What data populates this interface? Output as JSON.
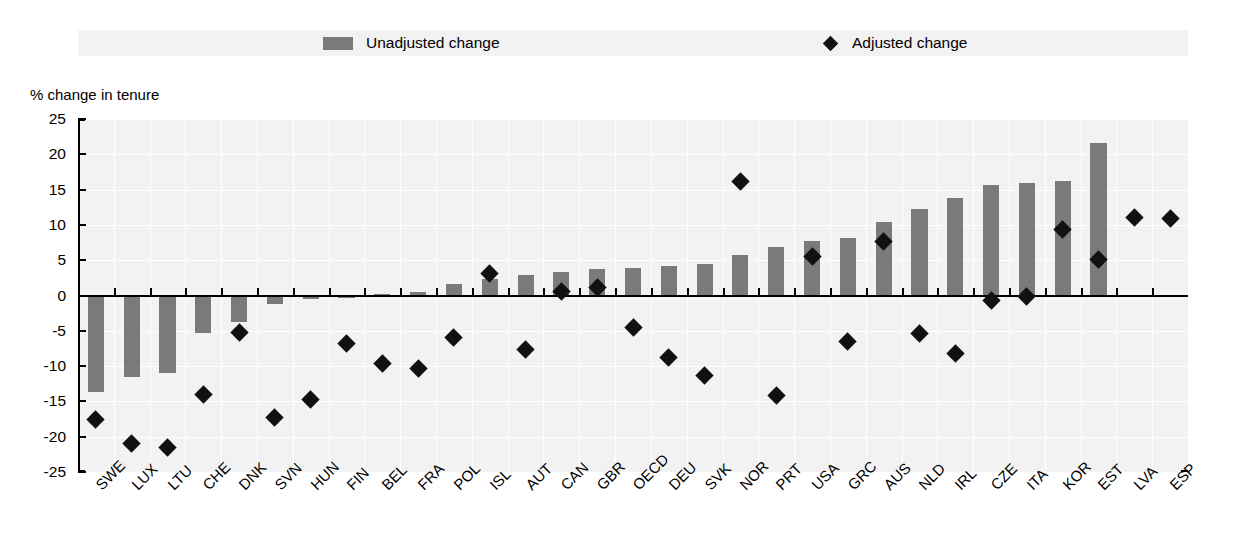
{
  "legend": {
    "bar_label": "Unadjusted change",
    "diamond_label": "Adjusted change",
    "bar_color": "#7a7a7a",
    "diamond_color": "#111111"
  },
  "axis": {
    "y_title": "% change in tenure",
    "y_ticks": [
      "25",
      "20",
      "15",
      "10",
      "5",
      "0",
      "-5",
      "-10",
      "-15",
      "-20",
      "-25"
    ]
  },
  "chart_data": {
    "type": "bar",
    "title": "",
    "xlabel": "",
    "ylabel": "% change in tenure",
    "ylim": [
      -25,
      25
    ],
    "ytick_values": [
      25,
      20,
      15,
      10,
      5,
      0,
      -5,
      -10,
      -15,
      -20,
      -25
    ],
    "grid": true,
    "legend_position": "top",
    "categories": [
      "SWE",
      "LUX",
      "LTU",
      "CHE",
      "DNK",
      "SVN",
      "HUN",
      "FIN",
      "BEL",
      "FRA",
      "POL",
      "ISL",
      "AUT",
      "CAN",
      "GBR",
      "OECD",
      "DEU",
      "SVK",
      "NOR",
      "PRT",
      "USA",
      "GRC",
      "AUS",
      "NLD",
      "IRL",
      "CZE",
      "ITA",
      "KOR",
      "EST",
      "LVA",
      "ESP"
    ],
    "series": [
      {
        "name": "Unadjusted change",
        "type": "bar",
        "color": "#7a7a7a",
        "values": [
          -13.7,
          -11.5,
          -11.0,
          -5.3,
          -3.8,
          -1.2,
          -0.5,
          -0.4,
          0.2,
          0.5,
          1.6,
          2.4,
          2.9,
          3.3,
          3.7,
          3.9,
          4.2,
          4.4,
          5.8,
          6.9,
          7.7,
          8.2,
          10.4,
          12.3,
          13.8,
          15.6,
          15.9,
          16.2,
          21.6,
          0,
          0
        ]
      },
      {
        "name": "Adjusted change",
        "type": "scatter",
        "color": "#111111",
        "values": [
          -17.5,
          -21.0,
          -21.5,
          -14.0,
          -5.2,
          -17.3,
          -14.8,
          -6.8,
          -9.6,
          -10.4,
          -5.9,
          3.1,
          -7.6,
          0.5,
          1.2,
          -4.6,
          -8.8,
          -11.4,
          16.1,
          -14.1,
          5.5,
          -6.5,
          7.7,
          -5.4,
          -8.2,
          -0.7,
          -0.2,
          9.3,
          5.1,
          11.0,
          10.9
        ]
      }
    ],
    "bar_values_by_category": {
      "SWE": -13.7,
      "LUX": -11.5,
      "LTU": -11.0,
      "CHE": -5.3,
      "DNK": -3.8,
      "SVN": -1.2,
      "HUN": -0.5,
      "FIN": -0.4,
      "BEL": 0.2,
      "FRA": 0.5,
      "POL": 1.6,
      "ISL": 2.4,
      "AUT": 2.9,
      "CAN": 3.3,
      "GBR": 3.7,
      "OECD": 3.9,
      "DEU": 4.2,
      "SVK": 4.4,
      "NOR": 5.8,
      "PRT": 6.9,
      "USA": 7.7,
      "GRC": 8.2,
      "AUS": 10.4,
      "NLD": 12.3,
      "IRL": 13.8,
      "CZE": 15.6,
      "ITA": 15.9,
      "KOR": 16.2,
      "EST": 21.6,
      "LVA": 0,
      "ESP": 0
    },
    "points": [
      {
        "category": "SWE",
        "bar": -13.7,
        "adjusted": -17.5
      },
      {
        "category": "LUX",
        "bar": -11.5,
        "adjusted": -21.0
      },
      {
        "category": "LTU",
        "bar": -11.0,
        "adjusted": -21.5
      },
      {
        "category": "CHE",
        "bar": -5.3,
        "adjusted": -14.0
      },
      {
        "category": "DNK",
        "bar": -3.8,
        "adjusted": -5.2
      },
      {
        "category": "SVN",
        "bar": -1.2,
        "adjusted": -17.3
      },
      {
        "category": "HUN",
        "bar": -0.5,
        "adjusted": -14.8
      },
      {
        "category": "FIN",
        "bar": -0.4,
        "adjusted": -6.8
      },
      {
        "category": "BEL",
        "bar": 0.2,
        "adjusted": -9.6
      },
      {
        "category": "FRA",
        "bar": 0.5,
        "adjusted": -10.4
      },
      {
        "category": "POL",
        "bar": 1.6,
        "adjusted": -5.9
      },
      {
        "category": "ISL",
        "bar": 2.4,
        "adjusted": 3.1
      },
      {
        "category": "AUT",
        "bar": 2.9,
        "adjusted": -7.6
      },
      {
        "category": "CAN",
        "bar": 3.3,
        "adjusted": 0.5
      },
      {
        "category": "GBR",
        "bar": 3.7,
        "adjusted": 1.2
      },
      {
        "category": "OECD",
        "bar": 3.9,
        "adjusted": -4.6
      },
      {
        "category": "DEU",
        "bar": 4.2,
        "adjusted": -8.8
      },
      {
        "category": "SVK",
        "bar": 4.4,
        "adjusted": -11.4
      },
      {
        "category": "NOR",
        "bar": 5.8,
        "adjusted": 16.1
      },
      {
        "category": "PRT",
        "bar": 6.9,
        "adjusted": -14.1
      },
      {
        "category": "USA",
        "bar": 7.7,
        "adjusted": 5.5
      },
      {
        "category": "GRC",
        "bar": 8.2,
        "adjusted": -6.5
      },
      {
        "category": "AUS",
        "bar": 10.4,
        "adjusted": 7.7
      },
      {
        "category": "NLD",
        "bar": 12.3,
        "adjusted": -5.4
      },
      {
        "category": "IRL",
        "bar": 13.8,
        "adjusted": -8.2
      },
      {
        "category": "CZE",
        "bar": 15.6,
        "adjusted": -0.7
      },
      {
        "category": "ITA",
        "bar": 15.9,
        "adjusted": -0.2
      },
      {
        "category": "KOR",
        "bar": 16.2,
        "adjusted": 9.3
      },
      {
        "category": "EST",
        "bar": 21.6,
        "adjusted": 5.1
      },
      {
        "category": "LVA",
        "bar": 0,
        "adjusted": 11.0
      },
      {
        "category": "ESP",
        "bar": 0,
        "adjusted": 10.9
      }
    ]
  }
}
